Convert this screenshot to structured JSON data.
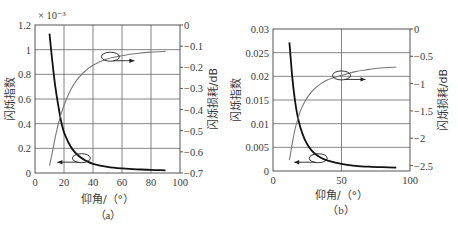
{
  "chart_data": [
    {
      "type": "line",
      "panel_caption": "（a）",
      "xlabel": "仰角/（°）",
      "ylabel_left": "闪烁指数",
      "ylabel_right": "闪烁损耗/dB",
      "y_left_multiplier": "× 10⁻³",
      "xlim": [
        0,
        100
      ],
      "ylim_left": [
        0,
        1.2
      ],
      "ylim_right": [
        -0.7,
        0
      ],
      "x_ticks": [
        "0",
        "20",
        "40",
        "60",
        "80",
        "100"
      ],
      "y_left_ticks": [
        "0",
        "0.2",
        "0.4",
        "0.6",
        "0.8",
        "1",
        "1.2"
      ],
      "y_right_ticks": [
        "0",
        "-0.1",
        "-0.2",
        "-0.3",
        "-0.4",
        "-0.5",
        "-0.6",
        "-0.7"
      ],
      "grid": {
        "x": [
          20,
          40,
          60,
          80
        ],
        "y_left": [
          0.2,
          0.4,
          0.6,
          0.8,
          1.0
        ]
      },
      "series": [
        {
          "name": "闪烁指数",
          "axis": "left",
          "color": "#111111",
          "x": [
            10,
            12,
            14,
            16,
            18,
            20,
            23,
            26,
            30,
            35,
            40,
            50,
            60,
            70,
            80,
            90
          ],
          "values": [
            1.13,
            0.9,
            0.7,
            0.55,
            0.42,
            0.33,
            0.25,
            0.19,
            0.14,
            0.1,
            0.075,
            0.05,
            0.037,
            0.03,
            0.025,
            0.022
          ]
        },
        {
          "name": "闪烁损耗",
          "axis": "right",
          "color": "#777777",
          "x": [
            10,
            12,
            14,
            16,
            18,
            20,
            23,
            26,
            30,
            35,
            40,
            50,
            60,
            70,
            80,
            90
          ],
          "values": [
            -0.665,
            -0.6,
            -0.53,
            -0.47,
            -0.42,
            -0.38,
            -0.33,
            -0.29,
            -0.25,
            -0.215,
            -0.19,
            -0.16,
            -0.145,
            -0.135,
            -0.128,
            -0.125
          ]
        }
      ],
      "annotations": [
        {
          "type": "ellipse-arrow",
          "target": "闪烁损耗",
          "at": [
            52,
            -0.15
          ],
          "arrow": "right"
        },
        {
          "type": "ellipse-arrow",
          "target": "闪烁指数",
          "at": [
            32,
            0.12
          ],
          "arrow": "left"
        }
      ]
    },
    {
      "type": "line",
      "panel_caption": "（b）",
      "xlabel": "仰角/（°）",
      "ylabel_left": "闪烁指数",
      "ylabel_right": "闪烁损耗/dB",
      "xlim": [
        0,
        100
      ],
      "ylim_left": [
        0,
        0.03
      ],
      "ylim_right": [
        -2.6,
        0
      ],
      "x_ticks": [
        "0",
        "50",
        "100"
      ],
      "y_left_ticks": [
        "0",
        "0.005",
        "0.01",
        "0.015",
        "0.02",
        "0.025",
        "0.03"
      ],
      "y_right_ticks": [
        "0",
        "-0.5",
        "-1",
        "-1.5",
        "-2",
        "-2.5"
      ],
      "grid": {
        "x": [
          50
        ],
        "y_left": [
          0.005,
          0.01,
          0.015,
          0.02,
          0.025
        ]
      },
      "series": [
        {
          "name": "闪烁指数",
          "axis": "left",
          "color": "#111111",
          "x": [
            12,
            14,
            16,
            18,
            20,
            23,
            26,
            30,
            35,
            40,
            50,
            60,
            70,
            80,
            90
          ],
          "values": [
            0.0272,
            0.02,
            0.015,
            0.0115,
            0.0092,
            0.0068,
            0.0052,
            0.0038,
            0.0028,
            0.0022,
            0.0015,
            0.0011,
            0.0009,
            0.0008,
            0.0007
          ]
        },
        {
          "name": "闪烁损耗",
          "axis": "right",
          "color": "#777777",
          "x": [
            12,
            14,
            16,
            18,
            20,
            23,
            26,
            30,
            35,
            40,
            50,
            60,
            70,
            80,
            90
          ],
          "values": [
            -2.4,
            -2.1,
            -1.85,
            -1.66,
            -1.5,
            -1.34,
            -1.22,
            -1.1,
            -1.0,
            -0.93,
            -0.85,
            -0.78,
            -0.74,
            -0.71,
            -0.7
          ]
        }
      ],
      "annotations": [
        {
          "type": "ellipse-arrow",
          "target": "闪烁损耗",
          "at": [
            50,
            -0.85
          ],
          "arrow": "right"
        },
        {
          "type": "ellipse-arrow",
          "target": "闪烁指数",
          "at": [
            33,
            0.0027
          ],
          "arrow": "left"
        }
      ]
    }
  ]
}
